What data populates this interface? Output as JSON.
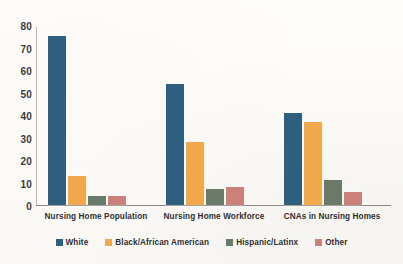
{
  "chart_data": {
    "type": "bar",
    "title": "",
    "xlabel": "",
    "ylabel": "",
    "ylim": [
      0,
      80
    ],
    "yticks": [
      80,
      70,
      60,
      50,
      40,
      30,
      20,
      10,
      0
    ],
    "grid": false,
    "legend_position": "bottom",
    "categories": [
      "Nursing Home Population",
      "Nursing Home Workforce",
      "CNAs in Nursing Homes"
    ],
    "series": [
      {
        "name": "White",
        "color": "#2e5f7f",
        "values": [
          75,
          54,
          41
        ]
      },
      {
        "name": "Black/African American",
        "color": "#f0a84a",
        "values": [
          13,
          28,
          37
        ]
      },
      {
        "name": "Hispanic/Latinx",
        "color": "#6b7a68",
        "values": [
          4,
          7,
          11
        ]
      },
      {
        "name": "Other",
        "color": "#cb8079",
        "values": [
          4,
          8,
          6
        ]
      }
    ]
  },
  "colors": {
    "white_series": "#2e5f7f",
    "black_series": "#f0a84a",
    "hispanic_series": "#6b7a68",
    "other_series": "#cb8079",
    "axis": "#8e8a83",
    "background": "#fdfcfa"
  }
}
